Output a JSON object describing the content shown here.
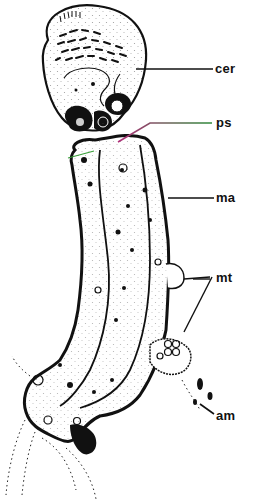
{
  "figure": {
    "type": "biological line drawing",
    "colors": {
      "ink": "#111111",
      "background": "#ffffff",
      "ps_leader_start": "#b0307a",
      "ps_leader_end": "#2e8b3a",
      "accent_green": "#3aa03a"
    }
  },
  "labels": [
    {
      "id": "cer",
      "text": "cer",
      "x": 215,
      "y": 62
    },
    {
      "id": "ps",
      "text": "ps",
      "x": 216,
      "y": 116
    },
    {
      "id": "ma",
      "text": "ma",
      "x": 216,
      "y": 191
    },
    {
      "id": "mt",
      "text": "mt",
      "x": 216,
      "y": 271
    },
    {
      "id": "am",
      "text": "am",
      "x": 216,
      "y": 409
    }
  ]
}
